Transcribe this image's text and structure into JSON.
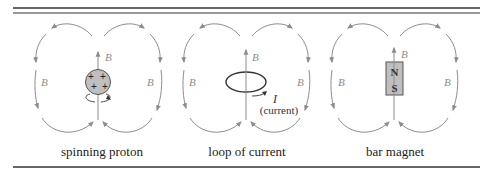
{
  "figure": {
    "panels": [
      {
        "id": "spinning-proton",
        "caption": "spinning proton",
        "axis_label": "B",
        "left_label": "B",
        "right_label": "B",
        "object": {
          "type": "proton",
          "charges": [
            "+",
            "+",
            "+",
            "+"
          ]
        }
      },
      {
        "id": "loop-of-current",
        "caption": "loop of current",
        "axis_label": "B",
        "left_label": "B",
        "right_label": "B",
        "object": {
          "type": "current-loop",
          "current_symbol": "I",
          "current_text": "(current)"
        }
      },
      {
        "id": "bar-magnet",
        "caption": "bar magnet",
        "axis_label": "B",
        "left_label": "B",
        "right_label": "B",
        "object": {
          "type": "magnet",
          "north": "N",
          "south": "S"
        }
      }
    ],
    "colors": {
      "field_lines": "#8c8c8c",
      "object_fill": "#bfbfbf",
      "rules": "#333333"
    }
  }
}
